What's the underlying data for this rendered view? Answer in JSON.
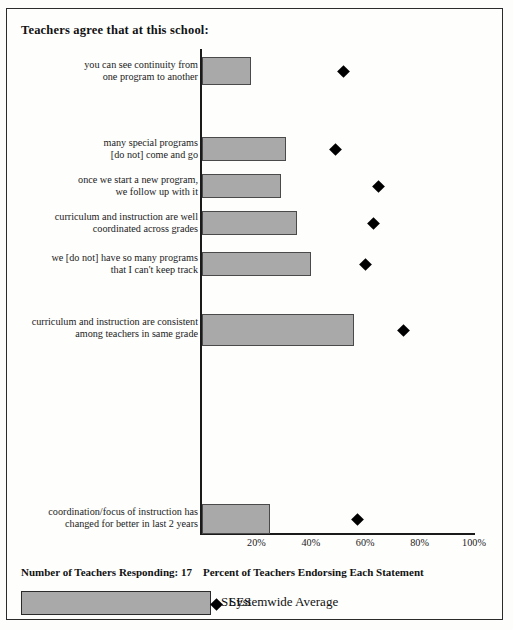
{
  "title": "Teachers agree that at this school:",
  "footer": {
    "respondents": "Number of Teachers Responding: 17",
    "axis_caption": "Percent of Teachers Endorsing Each Statement",
    "legend_bar": "SLES",
    "legend_point": "Systemwide Average"
  },
  "colors": {
    "bar_fill": "#a9a9a9",
    "bar_border": "#4a4a4a",
    "point": "#000000",
    "axis": "#1a1a1a"
  },
  "chart_data": {
    "type": "bar",
    "orientation": "horizontal",
    "title": "Teachers agree that at this school:",
    "xlabel": "Percent of Teachers Endorsing Each Statement",
    "ylabel": "",
    "xlim": [
      0,
      100
    ],
    "grid": false,
    "legend_position": "bottom",
    "tick_labels": [
      "20%",
      "40%",
      "60%",
      "80%",
      "100%"
    ],
    "tick_values": [
      20,
      40,
      60,
      80,
      100
    ],
    "categories": [
      "you can see continuity from\none program to another",
      "many special programs\n[do not] come and go",
      "once we start a new program,\nwe follow up with it",
      "curriculum and instruction are well\ncoordinated across grades",
      "we [do not] have so many programs\nthat I can't keep track",
      "curriculum and instruction are consistent\namong teachers in same grade",
      "coordination/focus of instruction has\nchanged for better in last 2 years"
    ],
    "series": [
      {
        "name": "SLES",
        "type": "bar",
        "values": [
          18,
          31,
          29,
          35,
          40,
          56,
          25
        ]
      },
      {
        "name": "Systemwide Average",
        "type": "scatter",
        "values": [
          52,
          49,
          65,
          63,
          60,
          74,
          57
        ]
      }
    ],
    "respondents": 17
  },
  "layout": {
    "rows": [
      {
        "top": 48,
        "height": 28,
        "label_top": 50
      },
      {
        "top": 128,
        "height": 24,
        "label_top": 128
      },
      {
        "top": 165,
        "height": 24,
        "label_top": 165
      },
      {
        "top": 202,
        "height": 24,
        "label_top": 202
      },
      {
        "top": 243,
        "height": 24,
        "label_top": 243
      },
      {
        "top": 305,
        "height": 32,
        "label_top": 307
      },
      {
        "top": 495,
        "height": 30,
        "label_top": 497
      }
    ]
  }
}
